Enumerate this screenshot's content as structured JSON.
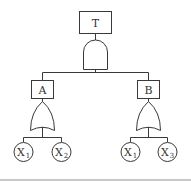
{
  "diagram": {
    "type": "fault-tree",
    "top_event": {
      "label": "T",
      "gate": "AND"
    },
    "intermediate_events": [
      {
        "label": "A",
        "gate": "OR",
        "inputs": [
          {
            "base": "X",
            "sub": "1"
          },
          {
            "base": "X",
            "sub": "2"
          }
        ]
      },
      {
        "label": "B",
        "gate": "OR",
        "inputs": [
          {
            "base": "X",
            "sub": "1"
          },
          {
            "base": "X",
            "sub": "3"
          }
        ]
      }
    ]
  }
}
